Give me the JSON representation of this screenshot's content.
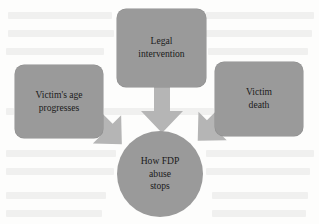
{
  "diagram": {
    "title": "How FDP abuse stops",
    "type": "convergent-flow-diagram",
    "colors": {
      "node_fill": "#9a9a9a",
      "arrow_fill": "#b5b5b5",
      "text": "#1b1b1b",
      "background": "#fdfdfc"
    },
    "nodes": {
      "legal": {
        "label": "Legal\nintervention",
        "shape": "rounded-rectangle",
        "position": "top-center"
      },
      "age": {
        "label": "Victim's age\nprogresses",
        "shape": "rounded-rectangle",
        "position": "left"
      },
      "death": {
        "label": "Victim\ndeath",
        "shape": "rounded-rectangle",
        "position": "right"
      },
      "outcome": {
        "label": "How FDP\nabuse\nstops",
        "shape": "circle",
        "position": "bottom-center"
      }
    },
    "arrows": [
      {
        "name": "legal-to-outcome",
        "from": "legal",
        "to": "outcome",
        "direction": "down"
      },
      {
        "name": "age-to-outcome",
        "from": "age",
        "to": "outcome",
        "direction": "down-right"
      },
      {
        "name": "death-to-outcome",
        "from": "death",
        "to": "outcome",
        "direction": "down-left"
      }
    ]
  }
}
